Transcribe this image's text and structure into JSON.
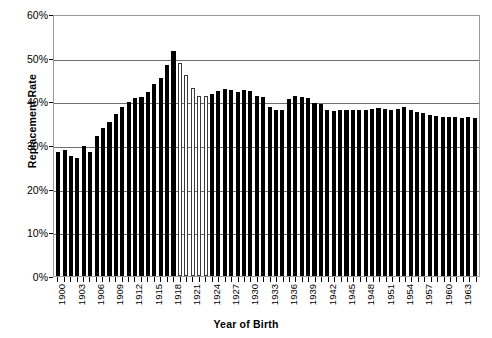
{
  "chart_data": {
    "type": "bar",
    "title": "",
    "xlabel": "Year of Birth",
    "ylabel": "Replacement Rate",
    "ylim": [
      0,
      60
    ],
    "yticks": [
      "0%",
      "10%",
      "20%",
      "30%",
      "40%",
      "50%",
      "60%"
    ],
    "ytick_values": [
      0,
      10,
      20,
      30,
      40,
      50,
      60
    ],
    "grid": true,
    "legend": "none",
    "xtick_labels": [
      "1900",
      "1903",
      "1906",
      "1909",
      "1912",
      "1915",
      "1918",
      "1921",
      "1924",
      "1927",
      "1930",
      "1933",
      "1936",
      "1939",
      "1942",
      "1945",
      "1948",
      "1951",
      "1954",
      "1957",
      "1960",
      "1963"
    ],
    "xtick_step": 3,
    "units": "percent",
    "series_colors": {
      "solid": "#000000",
      "hollow_fill": "#ffffff",
      "hollow_stroke": "#3a3a3a"
    },
    "categories": [
      1900,
      1901,
      1902,
      1903,
      1904,
      1905,
      1906,
      1907,
      1908,
      1909,
      1910,
      1911,
      1912,
      1913,
      1914,
      1915,
      1916,
      1917,
      1918,
      1919,
      1920,
      1921,
      1922,
      1923,
      1924,
      1925,
      1926,
      1927,
      1928,
      1929,
      1930,
      1931,
      1932,
      1933,
      1934,
      1935,
      1936,
      1937,
      1938,
      1939,
      1940,
      1941,
      1942,
      1943,
      1944,
      1945,
      1946,
      1947,
      1948,
      1949,
      1950,
      1951,
      1952,
      1953,
      1954,
      1955,
      1956,
      1957,
      1958,
      1959,
      1960,
      1961,
      1962,
      1963,
      1964,
      1965
    ],
    "values": [
      28.7,
      29.0,
      27.6,
      27.3,
      29.9,
      28.6,
      32.3,
      34.2,
      35.6,
      37.4,
      38.9,
      40.2,
      41.0,
      41.4,
      42.5,
      44.2,
      45.8,
      48.8,
      52.0,
      49.1,
      46.3,
      43.4,
      41.5,
      41.6,
      41.9,
      42.7,
      43.1,
      43.0,
      42.4,
      43.0,
      42.8,
      41.5,
      41.2,
      38.9,
      38.3,
      38.2,
      40.9,
      41.5,
      41.3,
      41.1,
      40.0,
      39.8,
      38.2,
      38.1,
      38.2,
      38.4,
      38.3,
      38.3,
      38.3,
      38.5,
      38.7,
      38.5,
      38.4,
      38.6,
      38.9,
      38.2,
      37.8,
      37.6,
      37.2,
      36.9,
      36.6,
      36.6,
      36.6,
      36.5,
      36.6,
      36.5
    ],
    "bar_styles": [
      "solid",
      "solid",
      "solid",
      "solid",
      "solid",
      "solid",
      "solid",
      "solid",
      "solid",
      "solid",
      "solid",
      "solid",
      "solid",
      "solid",
      "solid",
      "solid",
      "solid",
      "solid",
      "solid",
      "hollow",
      "hollow",
      "hollow",
      "hollow",
      "hollow",
      "solid",
      "solid",
      "solid",
      "solid",
      "solid",
      "solid",
      "solid",
      "solid",
      "solid",
      "solid",
      "solid",
      "solid",
      "solid",
      "solid",
      "solid",
      "solid",
      "solid",
      "solid",
      "solid",
      "solid",
      "solid",
      "solid",
      "solid",
      "solid",
      "solid",
      "solid",
      "solid",
      "solid",
      "solid",
      "solid",
      "solid",
      "solid",
      "solid",
      "solid",
      "solid",
      "solid",
      "solid",
      "solid",
      "solid",
      "solid",
      "solid",
      "solid"
    ]
  }
}
